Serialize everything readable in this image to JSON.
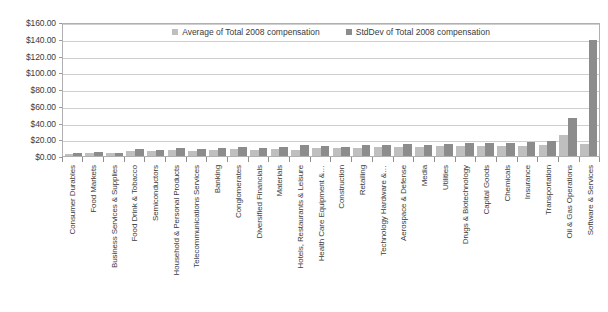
{
  "chart_data": {
    "type": "bar",
    "title": "",
    "subtitle": "",
    "xlabel": "",
    "ylabel": "",
    "ylim": [
      0,
      160
    ],
    "ytick_labels": [
      "$0.00",
      "$20.00",
      "$40.00",
      "$60.00",
      "$80.00",
      "$100.00",
      "$120.00",
      "$140.00",
      "$160.00"
    ],
    "ytick_values": [
      0,
      20,
      40,
      60,
      80,
      100,
      120,
      140,
      160
    ],
    "grid": true,
    "legend_position": "top-center",
    "categories": [
      "Consumer Durables",
      "Food Markets",
      "Business Services & Supplies",
      "Food Drink & Tobacco",
      "Semiconductors",
      "Household & Personal Products",
      "Telecommunications Services",
      "Banking",
      "Conglomerates",
      "Diversified Financials",
      "Materials",
      "Hotels, Restaurants & Leisure",
      "Health Care Equipment &…",
      "Construction",
      "Retailing",
      "Technology Hardware &…",
      "Aerospace & Defense",
      "Media",
      "Utilities",
      "Drugs & Biotechnology",
      "Capital Goods",
      "Chemicals",
      "Insurance",
      "Transportation",
      "Oil & Gas Operations",
      "Software & Services"
    ],
    "series": [
      {
        "name": "Average of Total 2008 compensation",
        "color": "#bfbfbf",
        "values": [
          3.0,
          4.0,
          3.5,
          6.5,
          6.0,
          7.5,
          6.0,
          7.0,
          8.0,
          7.5,
          8.0,
          7.0,
          9.0,
          9.0,
          10.0,
          10.5,
          10.5,
          11.0,
          11.5,
          11.5,
          12.0,
          12.0,
          12.5,
          13.0,
          25.0,
          14.0
        ]
      },
      {
        "name": "StdDev of Total 2008 compensation",
        "color": "#8c8c8c",
        "values": [
          3.5,
          4.5,
          4.0,
          8.0,
          7.5,
          9.0,
          8.5,
          9.0,
          10.5,
          10.0,
          11.0,
          13.0,
          11.5,
          11.0,
          13.5,
          13.5,
          14.0,
          13.0,
          14.5,
          15.5,
          16.0,
          15.0,
          16.5,
          18.0,
          45.0,
          139.0
        ]
      }
    ]
  },
  "legend": {
    "items": [
      {
        "label": "Average of Total 2008 compensation",
        "swatch_color": "#bfbfbf"
      },
      {
        "label": "StdDev of Total 2008 compensation",
        "swatch_color": "#8c8c8c"
      }
    ]
  }
}
